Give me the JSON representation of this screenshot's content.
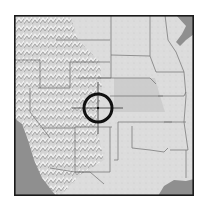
{
  "map": {
    "type": "shaded-relief",
    "region": "Western and Central United States",
    "colors": {
      "land": "#d8d8d8",
      "land_light": "#e4e4e4",
      "plains": "#cfcfcf",
      "water": "#8f8f8f",
      "border": "#6e6e6e",
      "frame": "#1a1a1a",
      "reticle": "#111111"
    }
  },
  "marker": {
    "icon": "crosshair-target-icon",
    "center_x": 98,
    "center_y": 108,
    "radius": 14
  }
}
